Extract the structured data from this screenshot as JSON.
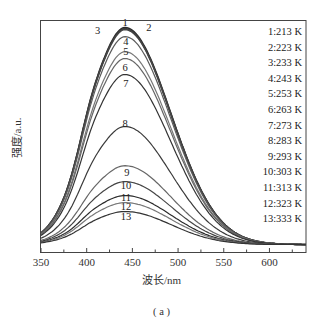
{
  "chart_data": {
    "type": "line",
    "title": "",
    "caption": "( a )",
    "xlabel": "波长/nm",
    "ylabel": "强度/a.u.",
    "xlim": [
      350,
      640
    ],
    "ylim": [
      0,
      100
    ],
    "xticks": [
      350,
      400,
      450,
      500,
      550,
      600
    ],
    "minor_xtick_step": 25,
    "yticks": [],
    "grid": false,
    "legend_position": "upper right",
    "peak_wavelength_nm": 442,
    "series": [
      {
        "name": "1:213 K",
        "label": "1",
        "peak": 95.2,
        "color": "#2a2a2a"
      },
      {
        "name": "2:223 K",
        "label": "2",
        "peak": 94.7,
        "color": "#3a3a3a"
      },
      {
        "name": "3:233 K",
        "label": "3",
        "peak": 94.3,
        "color": "#444444"
      },
      {
        "name": "4:243 K",
        "label": "4",
        "peak": 91.2,
        "color": "#5a5a5a"
      },
      {
        "name": "5:253 K",
        "label": "5",
        "peak": 84.6,
        "color": "#777777"
      },
      {
        "name": "6:263 K",
        "label": "6",
        "peak": 81.6,
        "color": "#666666"
      },
      {
        "name": "7:273 K",
        "label": "7",
        "peak": 74.6,
        "color": "#333333"
      },
      {
        "name": "8:283 K",
        "label": "8",
        "peak": 51.8,
        "color": "#3a3a3a"
      },
      {
        "name": "9:293 K",
        "label": "9",
        "peak": 34.6,
        "color": "#666666"
      },
      {
        "name": "10:303 K",
        "label": "10",
        "peak": 27.6,
        "color": "#444444"
      },
      {
        "name": "11:313 K",
        "label": "11",
        "peak": 21.5,
        "color": "#2a2a2a"
      },
      {
        "name": "12:323 K",
        "label": "12",
        "peak": 18.4,
        "color": "#777777"
      },
      {
        "name": "13:333 K",
        "label": "13",
        "peak": 14.5,
        "color": "#333333"
      }
    ],
    "curve_labels": [
      {
        "text": "1",
        "x": 442,
        "y": 99
      },
      {
        "text": "2",
        "x": 468,
        "y": 97
      },
      {
        "text": "3",
        "x": 412,
        "y": 95.5
      },
      {
        "text": "4",
        "x": 443,
        "y": 91
      },
      {
        "text": "5",
        "x": 443,
        "y": 86.5
      },
      {
        "text": "6",
        "x": 442,
        "y": 79.5
      },
      {
        "text": "7",
        "x": 443,
        "y": 72.5
      },
      {
        "text": "8",
        "x": 442,
        "y": 55
      },
      {
        "text": "9",
        "x": 444,
        "y": 33.5
      },
      {
        "text": "10",
        "x": 443,
        "y": 27.5
      },
      {
        "text": "11",
        "x": 443,
        "y": 22.5
      },
      {
        "text": "12",
        "x": 443,
        "y": 18.5
      },
      {
        "text": "13",
        "x": 443,
        "y": 14
      }
    ]
  }
}
